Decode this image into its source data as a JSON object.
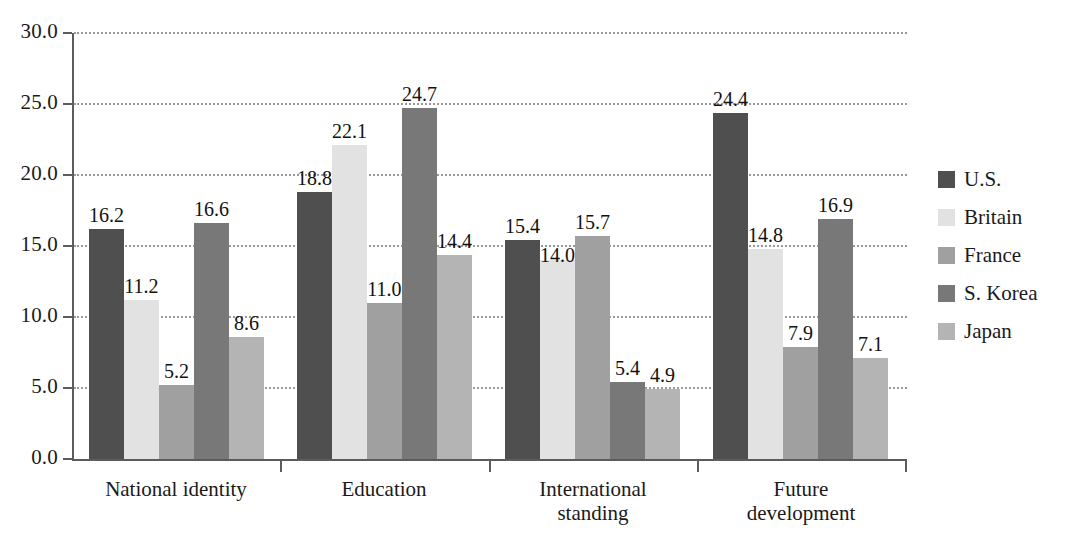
{
  "chart_data": {
    "type": "bar",
    "title": "",
    "subtitle": "",
    "xlabel": "",
    "ylabel": "",
    "ylim": [
      0.0,
      30.0
    ],
    "ytick_step": 5.0,
    "ytick_labels": [
      "0.0",
      "5.0",
      "10.0",
      "15.0",
      "20.0",
      "25.0",
      "30.0"
    ],
    "ytick_values": [
      0.0,
      5.0,
      10.0,
      15.0,
      20.0,
      25.0,
      30.0
    ],
    "grid": true,
    "grid_style": "dotted",
    "legend_position": "right",
    "categories": [
      "National identity",
      "Education",
      "International\nstanding",
      "Future\ndevelopment"
    ],
    "series": [
      {
        "name": "U.S.",
        "color": "#4f4f4f",
        "values": [
          16.2,
          18.8,
          15.4,
          24.4
        ]
      },
      {
        "name": "Britain",
        "color": "#e2e2e2",
        "values": [
          11.2,
          22.1,
          14.0,
          14.8
        ]
      },
      {
        "name": "France",
        "color": "#a0a0a0",
        "values": [
          5.2,
          11.0,
          15.7,
          7.9
        ]
      },
      {
        "name": "S. Korea",
        "color": "#787878",
        "values": [
          16.6,
          24.7,
          5.4,
          16.9
        ]
      },
      {
        "name": "Japan",
        "color": "#b4b4b4",
        "values": [
          8.6,
          14.4,
          4.9,
          7.1
        ]
      }
    ],
    "data_labels": [
      [
        "16.2",
        "11.2",
        "5.2",
        "16.6",
        "8.6"
      ],
      [
        "18.8",
        "22.1",
        "11.0",
        "24.7",
        "14.4"
      ],
      [
        "15.4",
        "14.0",
        "15.7",
        "5.4",
        "4.9"
      ],
      [
        "24.4",
        "14.8",
        "7.9",
        "16.9",
        "7.1"
      ]
    ]
  },
  "legend": {
    "items": [
      {
        "label": "U.S.",
        "color": "#4f4f4f"
      },
      {
        "label": "Britain",
        "color": "#e2e2e2"
      },
      {
        "label": "France",
        "color": "#a0a0a0"
      },
      {
        "label": "S. Korea",
        "color": "#787878"
      },
      {
        "label": "Japan",
        "color": "#b4b4b4"
      }
    ]
  }
}
